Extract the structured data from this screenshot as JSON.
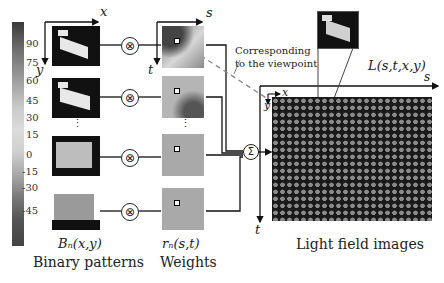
{
  "colorbar": {
    "ticks": [
      "90",
      "75",
      "60",
      "45",
      "30",
      "15",
      "0",
      "-15",
      "-30",
      "-45"
    ]
  },
  "axes": {
    "binary_x": "x",
    "binary_y": "y",
    "weights_s": "s",
    "weights_t": "t",
    "lf_s": "s",
    "lf_t": "t",
    "lf_x": "x",
    "lf_y": "y"
  },
  "annotation": {
    "corresponding_line1": "Corresponding",
    "corresponding_line2": "to the viewpoint",
    "lightfield_formula": "L(s,t,x,y)"
  },
  "ellipsis": "⋮",
  "operators": {
    "multiply": "⊗",
    "sum": "Σ"
  },
  "labels": {
    "binary_formula": "Bₙ(x,y)",
    "binary_title": "Binary patterns",
    "weights_formula": "rₙ(s,t)",
    "weights_title": "Weights",
    "lf_title": "Light field images"
  }
}
